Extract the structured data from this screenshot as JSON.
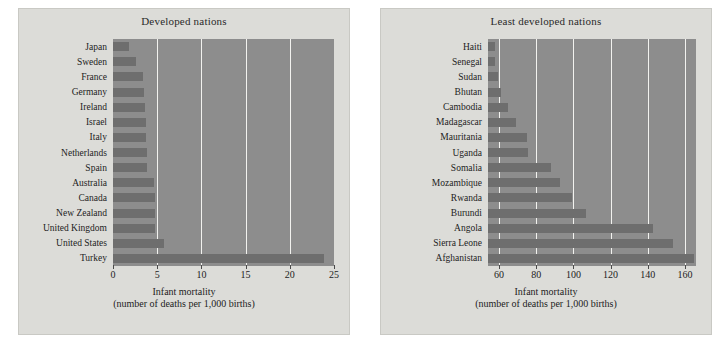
{
  "figure": {
    "background": "#dcdcd8",
    "plot_fill": "#8d8d8d",
    "bar_color": "#6e6e6e",
    "gridline_color": "#f2f2ef"
  },
  "axis_title": {
    "line1": "Infant mortality",
    "line2": "(number of deaths per 1,000 births)"
  },
  "chart_data": [
    {
      "type": "bar",
      "orientation": "horizontal",
      "title": "Developed nations",
      "xlabel": "Infant mortality (number of deaths per 1,000 births)",
      "ylabel": "",
      "xlim": [
        0,
        25
      ],
      "xticks": [
        0,
        5,
        10,
        15,
        20,
        25
      ],
      "xticklabels": [
        "0",
        "5",
        "10",
        "15",
        "20",
        "25"
      ],
      "grid": true,
      "legend": "none",
      "categories": [
        "Japan",
        "Sweden",
        "France",
        "Germany",
        "Ireland",
        "Israel",
        "Italy",
        "Netherlands",
        "Spain",
        "Australia",
        "Canada",
        "New Zealand",
        "United Kingdom",
        "United States",
        "Turkey"
      ],
      "values": [
        1.8,
        2.6,
        3.4,
        3.5,
        3.6,
        3.7,
        3.7,
        3.8,
        3.8,
        4.6,
        4.7,
        4.8,
        4.8,
        5.8,
        23.9
      ]
    },
    {
      "type": "bar",
      "orientation": "horizontal",
      "title": "Least developed nations",
      "xlabel": "Infant mortality (number of deaths per 1,000 births)",
      "ylabel": "",
      "xlim": [
        54,
        166
      ],
      "xticks": [
        60,
        80,
        100,
        120,
        140,
        160
      ],
      "xticklabels": [
        "60",
        "80",
        "100",
        "120",
        "140",
        "160"
      ],
      "grid": true,
      "legend": "none",
      "categories": [
        "Haiti",
        "Senegal",
        "Sudan",
        "Bhutan",
        "Cambodia",
        "Madagascar",
        "Mauritania",
        "Uganda",
        "Somalia",
        "Mozambique",
        "Rwanda",
        "Burundi",
        "Angola",
        "Sierra Leone",
        "Afghanistan"
      ],
      "values": [
        57.5,
        58.0,
        59.5,
        61.0,
        65.0,
        69.0,
        75.0,
        75.5,
        88.0,
        93.0,
        99.0,
        107.0,
        143.0,
        153.5,
        165.0
      ]
    }
  ]
}
